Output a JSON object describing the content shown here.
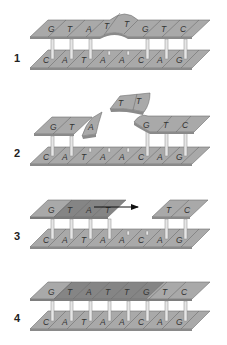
{
  "figure": {
    "type": "DNA mismatch repair schematic",
    "colors": {
      "strand": "#a9a9a9",
      "strand_dark": "#8a8a8a",
      "strand_edge": "#6e6e6e",
      "rung": "#e6e6e6",
      "rung_edge": "#8c8c8c",
      "text": "#333333"
    },
    "top_strand_sequence": [
      "G",
      "T",
      "A",
      "T",
      "T",
      "G",
      "T",
      "C"
    ],
    "bottom_strand_sequence": [
      "C",
      "A",
      "T",
      "A",
      "A",
      "C",
      "A",
      "G"
    ],
    "steps": [
      {
        "label": "1",
        "description": "Mismatched top strand with bulge at positions 4-5",
        "top": [
          "G",
          "T",
          "A",
          "T",
          "T",
          "G",
          "T",
          "C"
        ],
        "bottom": [
          "C",
          "A",
          "T",
          "A",
          "A",
          "C",
          "A",
          "G"
        ]
      },
      {
        "label": "2",
        "description": "Excision: segments A, T, T removed from top strand",
        "top_left": [
          "G",
          "T"
        ],
        "flap_a": [
          "A"
        ],
        "flap_tt": [
          "T",
          "T"
        ],
        "top_right": [
          "G",
          "T",
          "C"
        ],
        "bottom": [
          "C",
          "A",
          "T",
          "A",
          "A",
          "C",
          "A",
          "G"
        ]
      },
      {
        "label": "3",
        "description": "Resynthesis: new segment extends in direction of arrow",
        "top_left": [
          "G",
          "T",
          "A",
          "T"
        ],
        "top_right": [
          "T",
          "C"
        ],
        "bottom": [
          "C",
          "A",
          "T",
          "A",
          "A",
          "C",
          "A",
          "G"
        ],
        "arrow": "synthesis-direction-arrow"
      },
      {
        "label": "4",
        "description": "Repaired duplex",
        "top": [
          "G",
          "T",
          "A",
          "T",
          "T",
          "G",
          "T",
          "C"
        ],
        "bottom": [
          "C",
          "A",
          "T",
          "A",
          "A",
          "C",
          "A",
          "G"
        ]
      }
    ]
  }
}
